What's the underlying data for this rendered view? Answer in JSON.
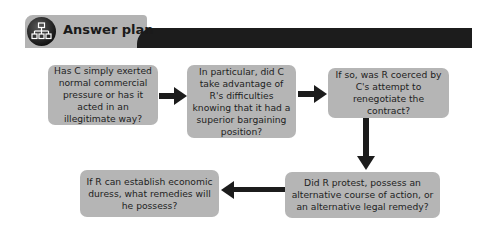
{
  "header": {
    "title": "Answer plan",
    "icon": "flowchart-hierarchy-icon"
  },
  "flow": {
    "steps": [
      {
        "id": 1,
        "text": "Has C simply exerted normal commercial pressure or has it acted in an illegitimate way?"
      },
      {
        "id": 2,
        "text": "In particular, did C take advantage of R's difficulties knowing that it had a superior bargaining position?"
      },
      {
        "id": 3,
        "text": "If so, was R coerced by C's attempt to renegotiate the contract?"
      },
      {
        "id": 4,
        "text": "Did R protest, possess an alternative course of action, or an alternative legal remedy?"
      },
      {
        "id": 5,
        "text": "If R can establish economic duress, what remedies will he possess?"
      }
    ],
    "connections": [
      {
        "from": 1,
        "to": 2,
        "direction": "right"
      },
      {
        "from": 2,
        "to": 3,
        "direction": "right"
      },
      {
        "from": 3,
        "to": 4,
        "direction": "down"
      },
      {
        "from": 4,
        "to": 5,
        "direction": "left"
      }
    ],
    "colors": {
      "box": "#b5b5b5",
      "arrow": "#1c1c1c",
      "header_bar": "#1c1c1c",
      "header_tab": "#b3b3b3"
    }
  }
}
